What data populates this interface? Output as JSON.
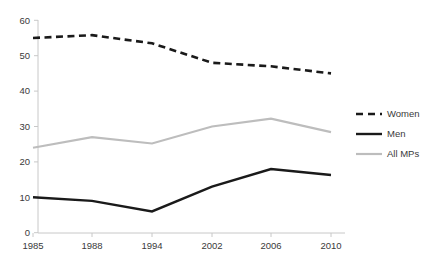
{
  "chart_data": {
    "type": "line",
    "title": "",
    "subtitle": "",
    "xlabel": "",
    "ylabel": "",
    "categories": [
      "1985",
      "1988",
      "1994",
      "2002",
      "2006",
      "2010"
    ],
    "ylim": [
      0,
      60
    ],
    "yticks": [
      "0",
      "10",
      "20",
      "30",
      "40",
      "50",
      "60"
    ],
    "ytick_values": [
      0,
      10,
      20,
      30,
      40,
      50,
      60
    ],
    "grid": false,
    "legend_position": "right",
    "series": [
      {
        "name": "Women",
        "values": [
          55,
          55.8,
          53.5,
          48,
          47,
          45
        ],
        "color": "#1a1a1a",
        "style": "dashed",
        "width": 2.6
      },
      {
        "name": "Men",
        "values": [
          10,
          9,
          6,
          13,
          18,
          16.3
        ],
        "color": "#1a1a1a",
        "style": "solid",
        "width": 2.4
      },
      {
        "name": "All MPs",
        "values": [
          24,
          27,
          25.2,
          30,
          32.2,
          28.4
        ],
        "color": "#bdbdbd",
        "style": "solid",
        "width": 2.2
      }
    ]
  },
  "legend": {
    "items": [
      {
        "label": "Women",
        "swatch": "dashed-black-line-swatch"
      },
      {
        "label": "Men",
        "swatch": "solid-black-line-swatch"
      },
      {
        "label": "All MPs",
        "swatch": "solid-gray-line-swatch"
      }
    ]
  },
  "axes": {
    "x_axis_name": "category-axis",
    "y_axis_name": "value-axis",
    "axis_color": "#c8c8c8"
  }
}
